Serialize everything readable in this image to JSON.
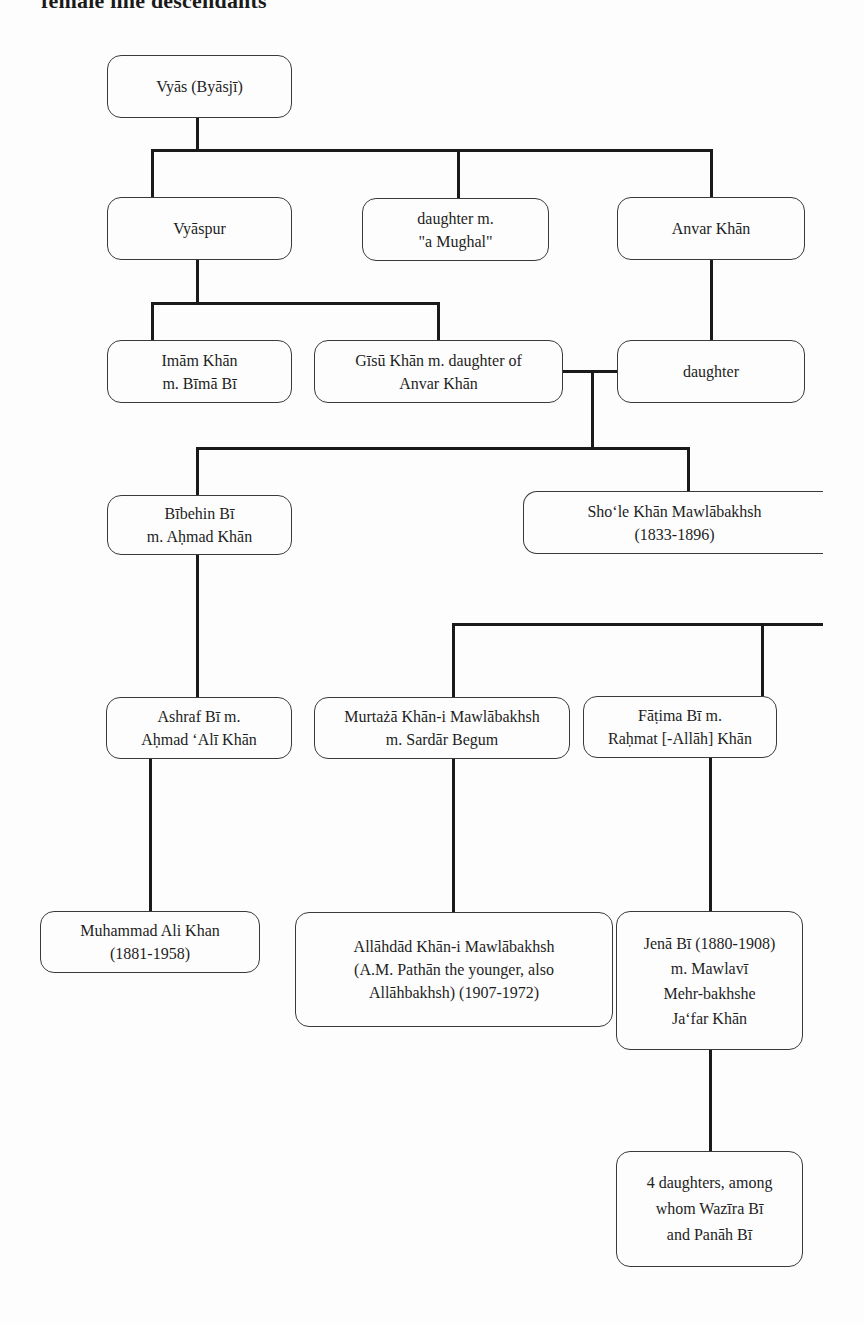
{
  "title": "female line descendants",
  "diagram": {
    "type": "family-tree",
    "nodes": {
      "vyas": {
        "lines": [
          "Vyās (Byāsjī)"
        ]
      },
      "vyaspur": {
        "lines": [
          "Vyāspur"
        ]
      },
      "daughter_mughal": {
        "lines": [
          "daughter m.",
          "\"a Mughal\""
        ]
      },
      "anvar_khan": {
        "lines": [
          "Anvar Khān"
        ]
      },
      "imam_khan": {
        "lines": [
          "Imām Khān",
          "m. Bīmā Bī"
        ]
      },
      "gisu_khan": {
        "lines": [
          "Gīsū Khān m. daughter of",
          "Anvar Khān"
        ]
      },
      "daughter": {
        "lines": [
          "daughter"
        ]
      },
      "bibehin_bi": {
        "lines": [
          "Bībehin Bī",
          "m. Aḥmad Khān"
        ]
      },
      "shole_khan": {
        "lines": [
          "Sho‘le Khān Mawlābakhsh",
          "(1833-1896)"
        ]
      },
      "ashraf_bi": {
        "lines": [
          "Ashraf Bī m.",
          "Aḥmad ‘Alī Khān"
        ]
      },
      "murtaza_khan": {
        "lines": [
          "Murtażā Khān-i Mawlābakhsh",
          "m. Sardār Begum"
        ]
      },
      "fatima_bi": {
        "lines": [
          "Fāṭima Bī m.",
          "Raḥmat [-Allāh] Khān"
        ]
      },
      "muhammad_ali_khan": {
        "lines": [
          "Muhammad Ali Khan",
          "(1881-1958)"
        ]
      },
      "allahdad_khan": {
        "lines": [
          "Allāhdād Khān-i Mawlābakhsh",
          "(A.M. Pathān the younger, also",
          "Allāhbakhsh) (1907-1972)"
        ]
      },
      "jena_bi": {
        "lines": [
          "Jenā Bī (1880-1908)",
          "m. Mawlavī",
          "Mehr-bakhshe",
          "Ja‘far Khān"
        ]
      },
      "four_daughters": {
        "lines": [
          "4 daughters, among",
          "whom Wazīra Bī",
          "and Panāh Bī"
        ]
      }
    },
    "edges": [
      [
        "vyas",
        "vyaspur"
      ],
      [
        "vyas",
        "daughter_mughal"
      ],
      [
        "vyas",
        "anvar_khan"
      ],
      [
        "vyaspur",
        "imam_khan"
      ],
      [
        "vyaspur",
        "gisu_khan"
      ],
      [
        "anvar_khan",
        "daughter"
      ],
      [
        "gisu_khan+daughter",
        "bibehin_bi"
      ],
      [
        "gisu_khan+daughter",
        "shole_khan"
      ],
      [
        "bibehin_bi",
        "ashraf_bi"
      ],
      [
        "shole_khan",
        "murtaza_khan"
      ],
      [
        "shole_khan",
        "fatima_bi"
      ],
      [
        "ashraf_bi",
        "muhammad_ali_khan"
      ],
      [
        "murtaza_khan",
        "allahdad_khan"
      ],
      [
        "fatima_bi",
        "jena_bi"
      ],
      [
        "jena_bi",
        "four_daughters"
      ]
    ],
    "line_color": "#1a1a1a",
    "box_border_color": "#3a3a3a"
  }
}
